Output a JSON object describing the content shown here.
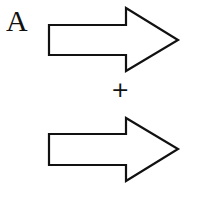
{
  "diagram": {
    "label": "A",
    "operator": "+",
    "arrows": [
      {
        "id": "arrow-top",
        "direction": "right"
      },
      {
        "id": "arrow-bottom",
        "direction": "right"
      }
    ],
    "colors": {
      "stroke": "#111111",
      "fill": "#ffffff"
    }
  }
}
